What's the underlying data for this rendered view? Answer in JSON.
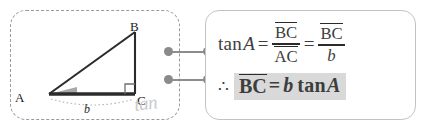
{
  "figure": {
    "panel_name": "triangle-figure-panel",
    "vertices": {
      "A": "A",
      "B": "B",
      "C": "C"
    },
    "side_label": "b",
    "watermark": "tan",
    "angle_marker_at": "A",
    "right_angle_at": "C",
    "colors": {
      "stroke": "#2b2b2b",
      "panel_border": "#9a9a9a",
      "angle_fill": "#a8a8a8",
      "dimension_arc": "#b5b5b5",
      "watermark": "#c9c9c9"
    }
  },
  "connectors": {
    "name": "panel-connector-dots",
    "rows": [
      {
        "label": "connector-row-top"
      },
      {
        "label": "connector-row-bottom"
      }
    ],
    "dot_color": "#8a8a8a",
    "line_color": "#8d8d8d"
  },
  "formula": {
    "panel_name": "formula-panel",
    "panel_border": "#c3c3c3",
    "highlight_color": "#d9d9d9",
    "line1": {
      "fn": "tan",
      "angle": "A",
      "equals_1": "=",
      "frac1_num": "BC",
      "frac1_den": "AC",
      "equals_2": "=",
      "frac2_num": "BC",
      "frac2_den": "b"
    },
    "line2": {
      "therefore": "∴",
      "left": "BC",
      "equals": "=",
      "coef": "b",
      "fn": "tan",
      "angle": "A"
    }
  }
}
